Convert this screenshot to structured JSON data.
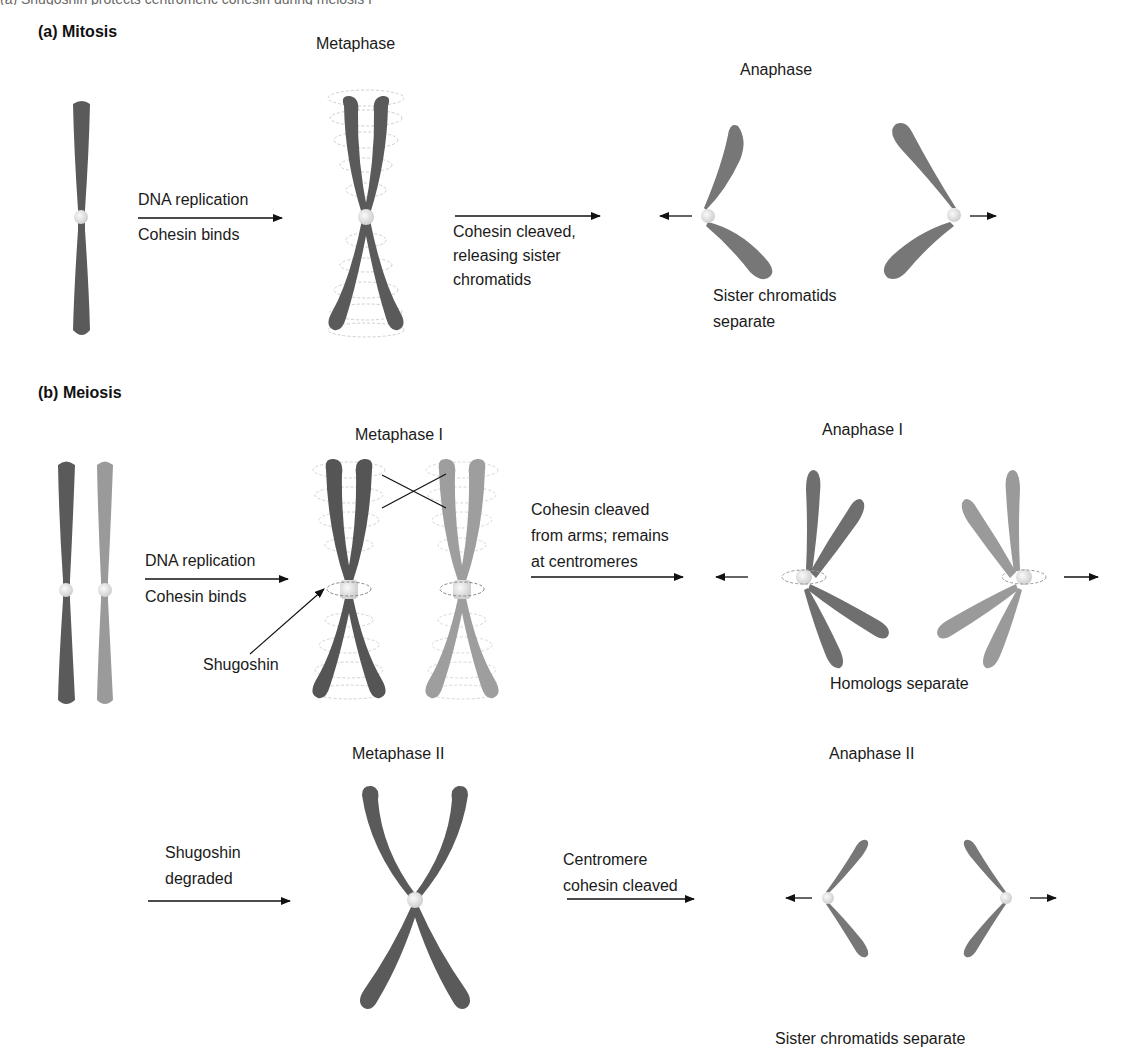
{
  "caption_fragment": "(a) Shugoshin protects centromeric cohesin during meiosis I",
  "colors": {
    "chromosome_dark": "#5a5a5a",
    "chromosome_light": "#9a9a9a",
    "centromere": "#e4e4e4",
    "cohesin_ring": "#c8c8c8",
    "arrow": "#111111"
  },
  "mitosis": {
    "title": "(a) Mitosis",
    "stages": {
      "metaphase": "Metaphase",
      "anaphase": "Anaphase"
    },
    "steps": {
      "replication_top": "DNA replication",
      "replication_bottom": "Cohesin binds",
      "cleave_line1": "Cohesin cleaved,",
      "cleave_line2": "releasing sister",
      "cleave_line3": "chromatids"
    },
    "result_line1": "Sister chromatids",
    "result_line2": "separate"
  },
  "meiosis": {
    "title": "(b) Meiosis",
    "stages": {
      "metaphase_1": "Metaphase I",
      "anaphase_1": "Anaphase I",
      "metaphase_2": "Metaphase II",
      "anaphase_2": "Anaphase II"
    },
    "steps": {
      "replication_top": "DNA replication",
      "replication_bottom": "Cohesin binds",
      "shugoshin_pointer": "Shugoshin",
      "arms_line1": "Cohesin cleaved",
      "arms_line2": "from arms; remains",
      "arms_line3": "at centromeres",
      "degraded_line1": "Shugoshin",
      "degraded_line2": "degraded",
      "centromere_line1": "Centromere",
      "centromere_line2": "cohesin cleaved"
    },
    "result_1": "Homologs separate",
    "result_2": "Sister chromatids separate"
  }
}
